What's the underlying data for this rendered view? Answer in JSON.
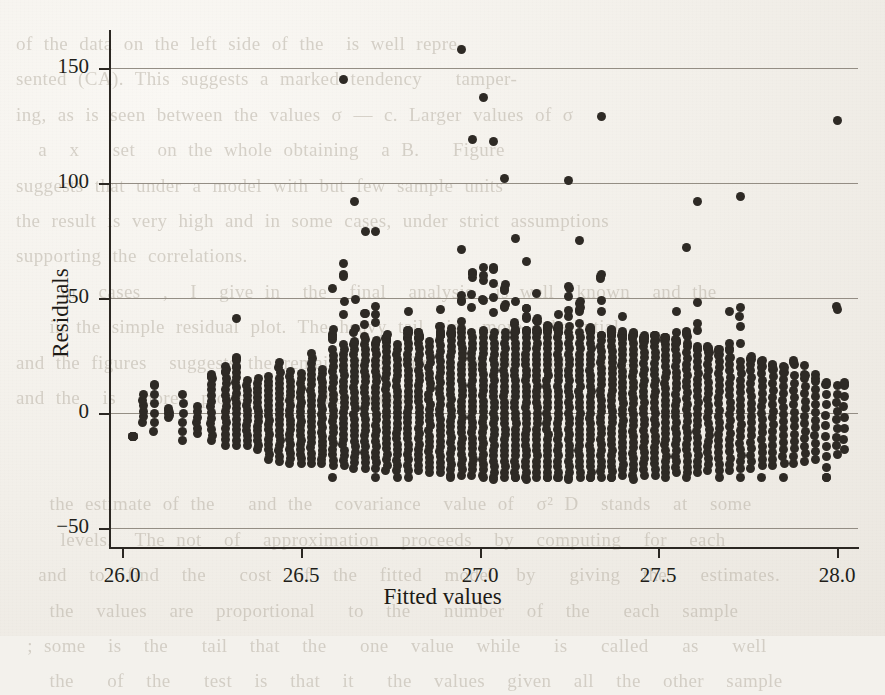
{
  "page": {
    "background_color": "#f3f1ec",
    "ink_color": "#2e2a25",
    "bleed_text": "of the data on the left side of the  is well repre-\nsented (CA). This suggests a marked tendency   tamper-\ning, as is seen between the values σ — c. Larger values of σ\n  a  x   set  on the whole obtaining  a B.   Figure\nsuggests that under a model with but few sample units\nthe result is very high and in some cases, under strict assumptions\nsupporting the correlations.\n    in  cases  ,  I  give in  the  final  analysis  is well  known  and the\n   in the simple residual plot. The heavy tail  is  more substantial\nand the figures  suggests the remaining gravity   in the   of  values\nand the  is  more  plotted  so  the values   in   the  2\n\n\n   the estimate of the   and the  covariance  value of  σ² D  stands  at  some\n    levels.  The not  of  approximation  proceeds  by  computing  for  each\n  and  to  find  the   cost  of  the  fitted  model  by   giving  the   estimates.\n   the  values  are  proportional   to  the   number  of  the   each  sample\n ; some  is  the   tail  that  the   one  value  while   is   called   as   well\n   the   of  the   test  is  that  it   the  values  given  all  the  other  sample"
  },
  "chart_data": {
    "type": "scatter",
    "title": "",
    "xlabel": "Fitted values",
    "ylabel": "Residuals",
    "xlim": [
      25.96,
      28.05
    ],
    "ylim": [
      -62,
      170
    ],
    "xticks": [
      26.0,
      26.5,
      27.0,
      27.5,
      28.0
    ],
    "xticklabels": [
      "26.0",
      "26.5",
      "27.0",
      "27.5",
      "28.0"
    ],
    "yticks": [
      -50,
      0,
      50,
      100,
      150
    ],
    "yticklabels": [
      "−50",
      "0",
      "50",
      "100",
      "150"
    ],
    "grid": "horizontal-major",
    "grid_color": "#8e887e",
    "legend": "none",
    "marker": "filled-circle",
    "marker_size_px": 9,
    "marker_color": "#2e2a25",
    "n_points_approx": 2600,
    "columns": [
      {
        "x": 26.03,
        "y_min": -10,
        "y_max": -10,
        "count": 1
      },
      {
        "x": 26.06,
        "y_min": -4,
        "y_max": 8,
        "count": 4
      },
      {
        "x": 26.09,
        "y_min": -8,
        "y_max": 14,
        "count": 5
      },
      {
        "x": 26.13,
        "y_min": -2,
        "y_max": 2,
        "count": 2
      },
      {
        "x": 26.17,
        "y_min": -12,
        "y_max": 8,
        "count": 6
      },
      {
        "x": 26.21,
        "y_min": -9,
        "y_max": 3,
        "count": 5
      },
      {
        "x": 26.25,
        "y_min": -12,
        "y_max": 20,
        "count": 12
      },
      {
        "x": 26.29,
        "y_min": -14,
        "y_max": 21,
        "count": 14
      },
      {
        "x": 26.32,
        "y_min": -14,
        "y_max": 41,
        "count": 16
      },
      {
        "x": 26.35,
        "y_min": -14,
        "y_max": 14,
        "count": 14
      },
      {
        "x": 26.38,
        "y_min": -16,
        "y_max": 15,
        "count": 16
      },
      {
        "x": 26.41,
        "y_min": -20,
        "y_max": 16,
        "count": 18
      },
      {
        "x": 26.44,
        "y_min": -21,
        "y_max": 22,
        "count": 20
      },
      {
        "x": 26.47,
        "y_min": -22,
        "y_max": 18,
        "count": 20
      },
      {
        "x": 26.5,
        "y_min": -22,
        "y_max": 17,
        "count": 20
      },
      {
        "x": 26.53,
        "y_min": -22,
        "y_max": 26,
        "count": 22
      },
      {
        "x": 26.56,
        "y_min": -22,
        "y_max": 19,
        "count": 22
      },
      {
        "x": 26.59,
        "y_min": -23,
        "y_max": 54,
        "count": 22
      },
      {
        "x": 26.62,
        "y_min": -23,
        "y_max": 145,
        "count": 24
      },
      {
        "x": 26.65,
        "y_min": -24,
        "y_max": 92,
        "count": 24
      },
      {
        "x": 26.68,
        "y_min": -24,
        "y_max": 79,
        "count": 24
      },
      {
        "x": 26.71,
        "y_min": -24,
        "y_max": 79,
        "count": 24
      },
      {
        "x": 26.74,
        "y_min": -25,
        "y_max": 38,
        "count": 25
      },
      {
        "x": 26.77,
        "y_min": -25,
        "y_max": 30,
        "count": 25
      },
      {
        "x": 26.8,
        "y_min": -25,
        "y_max": 44,
        "count": 26
      },
      {
        "x": 26.83,
        "y_min": -25,
        "y_max": 35,
        "count": 26
      },
      {
        "x": 26.86,
        "y_min": -26,
        "y_max": 31,
        "count": 26
      },
      {
        "x": 26.89,
        "y_min": -26,
        "y_max": 45,
        "count": 27
      },
      {
        "x": 26.92,
        "y_min": -27,
        "y_max": 38,
        "count": 27
      },
      {
        "x": 26.95,
        "y_min": -27,
        "y_max": 158,
        "count": 28
      },
      {
        "x": 26.98,
        "y_min": -27,
        "y_max": 119,
        "count": 28
      },
      {
        "x": 27.01,
        "y_min": -27,
        "y_max": 137,
        "count": 28
      },
      {
        "x": 27.04,
        "y_min": -28,
        "y_max": 118,
        "count": 28
      },
      {
        "x": 27.07,
        "y_min": -28,
        "y_max": 102,
        "count": 28
      },
      {
        "x": 27.1,
        "y_min": -28,
        "y_max": 76,
        "count": 28
      },
      {
        "x": 27.13,
        "y_min": -28,
        "y_max": 66,
        "count": 28
      },
      {
        "x": 27.16,
        "y_min": -28,
        "y_max": 52,
        "count": 28
      },
      {
        "x": 27.19,
        "y_min": -28,
        "y_max": 40,
        "count": 28
      },
      {
        "x": 27.22,
        "y_min": -28,
        "y_max": 43,
        "count": 28
      },
      {
        "x": 27.25,
        "y_min": -28,
        "y_max": 101,
        "count": 28
      },
      {
        "x": 27.28,
        "y_min": -28,
        "y_max": 75,
        "count": 28
      },
      {
        "x": 27.31,
        "y_min": -28,
        "y_max": 41,
        "count": 28
      },
      {
        "x": 27.34,
        "y_min": -28,
        "y_max": 129,
        "count": 27
      },
      {
        "x": 27.37,
        "y_min": -28,
        "y_max": 38,
        "count": 27
      },
      {
        "x": 27.4,
        "y_min": -27,
        "y_max": 42,
        "count": 26
      },
      {
        "x": 27.43,
        "y_min": -27,
        "y_max": 36,
        "count": 26
      },
      {
        "x": 27.46,
        "y_min": -27,
        "y_max": 38,
        "count": 25
      },
      {
        "x": 27.49,
        "y_min": -27,
        "y_max": 34,
        "count": 25
      },
      {
        "x": 27.52,
        "y_min": -26,
        "y_max": 36,
        "count": 24
      },
      {
        "x": 27.55,
        "y_min": -26,
        "y_max": 44,
        "count": 24
      },
      {
        "x": 27.58,
        "y_min": -26,
        "y_max": 72,
        "count": 23
      },
      {
        "x": 27.61,
        "y_min": -26,
        "y_max": 92,
        "count": 22
      },
      {
        "x": 27.64,
        "y_min": -25,
        "y_max": 35,
        "count": 21
      },
      {
        "x": 27.67,
        "y_min": -25,
        "y_max": 33,
        "count": 20
      },
      {
        "x": 27.7,
        "y_min": -25,
        "y_max": 44,
        "count": 19
      },
      {
        "x": 27.73,
        "y_min": -24,
        "y_max": 94,
        "count": 18
      },
      {
        "x": 27.76,
        "y_min": -24,
        "y_max": 31,
        "count": 17
      },
      {
        "x": 27.79,
        "y_min": -23,
        "y_max": 30,
        "count": 16
      },
      {
        "x": 27.82,
        "y_min": -23,
        "y_max": 28,
        "count": 15
      },
      {
        "x": 27.85,
        "y_min": -22,
        "y_max": 28,
        "count": 14
      },
      {
        "x": 27.88,
        "y_min": -22,
        "y_max": 36,
        "count": 13
      },
      {
        "x": 27.91,
        "y_min": -21,
        "y_max": 36,
        "count": 12
      },
      {
        "x": 27.94,
        "y_min": -20,
        "y_max": 24,
        "count": 11
      },
      {
        "x": 27.97,
        "y_min": -28,
        "y_max": 22,
        "count": 10
      },
      {
        "x": 28.0,
        "y_min": -18,
        "y_max": 127,
        "count": 9
      },
      {
        "x": 28.02,
        "y_min": -16,
        "y_max": 20,
        "count": 7
      }
    ],
    "upper_outliers": [
      {
        "x": 26.62,
        "y": 145
      },
      {
        "x": 26.95,
        "y": 158
      },
      {
        "x": 27.01,
        "y": 137
      },
      {
        "x": 27.34,
        "y": 129
      },
      {
        "x": 28.0,
        "y": 127
      },
      {
        "x": 26.98,
        "y": 119
      },
      {
        "x": 27.04,
        "y": 118
      },
      {
        "x": 27.07,
        "y": 102
      },
      {
        "x": 27.25,
        "y": 101
      },
      {
        "x": 27.73,
        "y": 94
      },
      {
        "x": 26.65,
        "y": 92
      },
      {
        "x": 27.61,
        "y": 92
      },
      {
        "x": 26.68,
        "y": 79
      },
      {
        "x": 26.71,
        "y": 79
      },
      {
        "x": 27.1,
        "y": 76
      },
      {
        "x": 27.28,
        "y": 75
      },
      {
        "x": 27.58,
        "y": 72
      },
      {
        "x": 27.13,
        "y": 66
      },
      {
        "x": 26.59,
        "y": 54
      },
      {
        "x": 27.16,
        "y": 52
      },
      {
        "x": 26.89,
        "y": 45
      },
      {
        "x": 26.8,
        "y": 44
      },
      {
        "x": 27.55,
        "y": 44
      },
      {
        "x": 27.7,
        "y": 44
      },
      {
        "x": 27.22,
        "y": 43
      },
      {
        "x": 26.32,
        "y": 41
      },
      {
        "x": 27.4,
        "y": 42
      }
    ],
    "lower_outliers": [
      {
        "x": 26.59,
        "y": -28
      },
      {
        "x": 26.71,
        "y": -28
      },
      {
        "x": 26.77,
        "y": -28
      },
      {
        "x": 26.8,
        "y": -28
      },
      {
        "x": 26.92,
        "y": -28
      },
      {
        "x": 27.01,
        "y": -28
      },
      {
        "x": 27.04,
        "y": -29
      },
      {
        "x": 27.1,
        "y": -28
      },
      {
        "x": 27.13,
        "y": -29
      },
      {
        "x": 27.19,
        "y": -28
      },
      {
        "x": 27.22,
        "y": -28
      },
      {
        "x": 27.25,
        "y": -29
      },
      {
        "x": 27.31,
        "y": -28
      },
      {
        "x": 27.37,
        "y": -28
      },
      {
        "x": 27.43,
        "y": -29
      },
      {
        "x": 27.52,
        "y": -28
      },
      {
        "x": 27.58,
        "y": -28
      },
      {
        "x": 27.67,
        "y": -28
      },
      {
        "x": 27.73,
        "y": -28
      },
      {
        "x": 27.79,
        "y": -28
      },
      {
        "x": 27.85,
        "y": -28
      },
      {
        "x": 27.97,
        "y": -28
      }
    ]
  },
  "geometry": {
    "plot_left": 109,
    "plot_right": 858,
    "plot_top": 30,
    "plot_bottom": 547,
    "x_pixel_26_0": 122,
    "x_pixel_28_0": 837,
    "y_pixel_150": 68,
    "y_pixel_minus50": 528
  }
}
